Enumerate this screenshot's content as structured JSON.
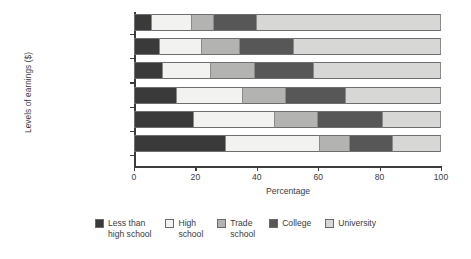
{
  "chart_data": {
    "type": "bar",
    "orientation": "horizontal",
    "stacked": true,
    "normalized_to_percent": true,
    "title": "",
    "xlabel": "Percentage",
    "ylabel": "Levels of earnings ($)",
    "xlim": [
      0,
      100
    ],
    "xticks": [
      0,
      20,
      40,
      60,
      80,
      100
    ],
    "xtick_labels": [
      "0",
      "20",
      "40",
      "60",
      "80",
      "100"
    ],
    "grid": false,
    "legend_position": "bottom",
    "categories": [
      "100 000 or more",
      "80 000 to 99 999",
      "60 000 to 79 999",
      "40 000 to 59 999",
      "20 000 to 39 999",
      "Less than 20 000"
    ],
    "series": [
      {
        "name": "Less than high school",
        "legend_label": "Less than\nhigh school",
        "color": "#3a3a3a",
        "values": [
          6.0,
          8.5,
          9.5,
          14.0,
          19.5,
          30.0
        ]
      },
      {
        "name": "High school",
        "legend_label": "High\nschool",
        "color": "#f2f2f0",
        "values": [
          13.0,
          13.5,
          15.5,
          21.5,
          26.5,
          30.5
        ]
      },
      {
        "name": "Trade school",
        "legend_label": "Trade\nschool",
        "color": "#b3b3b1",
        "values": [
          7.0,
          12.5,
          14.5,
          14.0,
          14.0,
          10.0
        ]
      },
      {
        "name": "College",
        "legend_label": "College",
        "color": "#575757",
        "values": [
          14.0,
          17.5,
          19.0,
          19.5,
          21.0,
          14.0
        ]
      },
      {
        "name": "University",
        "legend_label": "University",
        "color": "#d7d7d5",
        "values": [
          60.0,
          48.0,
          41.5,
          31.0,
          19.0,
          15.5
        ]
      }
    ]
  }
}
